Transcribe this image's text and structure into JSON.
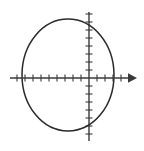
{
  "figure": {
    "background_color": "#ffffff",
    "stroke_color": "#2b2b2b",
    "axis_color": "#3a3a3a",
    "width": 144,
    "height": 151
  },
  "chart_data": {
    "type": "scatter",
    "title": "",
    "subtitle": "",
    "xlabel": "",
    "ylabel": "",
    "grid": false,
    "legend": null,
    "annotations": [],
    "axes": {
      "x_axis": {
        "orientation": "horizontal",
        "pixel_y": 78,
        "pixel_x_start": 10,
        "pixel_x_end": 135,
        "arrow": "right",
        "tick_count": 14,
        "tick_spacing_px": 8,
        "tick_length_px": 7,
        "tick_values": [
          -9,
          -8,
          -7,
          -6,
          -5,
          -4,
          -3,
          -2,
          -1,
          0,
          1,
          2,
          3,
          4
        ],
        "tick_labels": []
      },
      "y_axis": {
        "orientation": "vertical",
        "pixel_x": 89,
        "pixel_y_start": 12,
        "pixel_y_end": 141,
        "arrow": "none",
        "tick_count": 15,
        "tick_spacing_px": 8,
        "tick_length_px": 7,
        "tick_values": [
          8,
          7,
          6,
          5,
          4,
          3,
          2,
          1,
          0,
          -1,
          -2,
          -3,
          -4,
          -5,
          -6
        ],
        "tick_labels": []
      },
      "origin_px": {
        "x": 89,
        "y": 78
      },
      "units_per_tick": 1,
      "px_per_unit": 8,
      "xlim": [
        -10,
        6
      ],
      "ylim": [
        -8,
        9
      ]
    },
    "series": [
      {
        "name": "ellipse",
        "shape": "ellipse",
        "center_px": {
          "x": 68,
          "y": 75
        },
        "radius_x_px": 46,
        "radius_y_px": 56,
        "center_units": {
          "x": -2.6,
          "y": 0.4
        },
        "semi_axis_x_units": 5.75,
        "semi_axis_y_units": 7.0,
        "x_intercepts_px": [
          22,
          114
        ],
        "y_extremes_px": [
          19,
          131
        ],
        "closed": true,
        "stroke_color": "#2b2b2b",
        "fill": "none"
      }
    ]
  }
}
